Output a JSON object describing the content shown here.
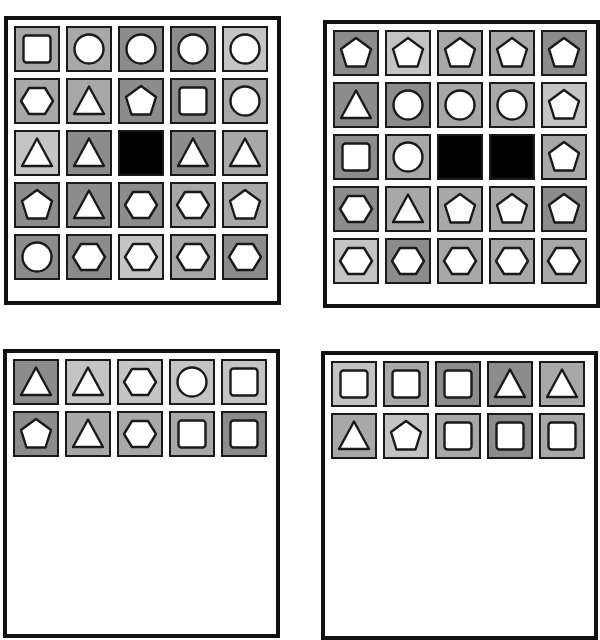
{
  "colors": {
    "dark": "#8c8c8c",
    "mid": "#a8a8a8",
    "light": "#c4c4c4",
    "black": "#000000",
    "shape_fill": "#ffffff",
    "shape_stroke": "#1a1a1a"
  },
  "panels": [
    {
      "id": "top-left",
      "rows": [
        [
          [
            "mid",
            "square"
          ],
          [
            "mid",
            "circle"
          ],
          [
            "dark",
            "circle"
          ],
          [
            "dark",
            "circle"
          ],
          [
            "light",
            "circle"
          ]
        ],
        [
          [
            "mid",
            "hexagon"
          ],
          [
            "mid",
            "triangle"
          ],
          [
            "dark",
            "pentagon"
          ],
          [
            "dark",
            "square"
          ],
          [
            "mid",
            "circle"
          ]
        ],
        [
          [
            "light",
            "triangle"
          ],
          [
            "dark",
            "triangle"
          ],
          [
            "black",
            "none"
          ],
          [
            "dark",
            "triangle"
          ],
          [
            "mid",
            "triangle"
          ]
        ],
        [
          [
            "dark",
            "pentagon"
          ],
          [
            "dark",
            "triangle"
          ],
          [
            "dark",
            "hexagon"
          ],
          [
            "mid",
            "hexagon"
          ],
          [
            "mid",
            "pentagon"
          ]
        ],
        [
          [
            "dark",
            "circle"
          ],
          [
            "dark",
            "hexagon"
          ],
          [
            "light",
            "hexagon"
          ],
          [
            "mid",
            "hexagon"
          ],
          [
            "dark",
            "hexagon"
          ]
        ]
      ]
    },
    {
      "id": "top-right",
      "rows": [
        [
          [
            "dark",
            "pentagon"
          ],
          [
            "light",
            "pentagon"
          ],
          [
            "mid",
            "pentagon"
          ],
          [
            "mid",
            "pentagon"
          ],
          [
            "dark",
            "pentagon"
          ]
        ],
        [
          [
            "dark",
            "triangle"
          ],
          [
            "dark",
            "circle"
          ],
          [
            "mid",
            "circle"
          ],
          [
            "mid",
            "circle"
          ],
          [
            "light",
            "pentagon"
          ]
        ],
        [
          [
            "dark",
            "square"
          ],
          [
            "mid",
            "circle"
          ],
          [
            "black",
            "none"
          ],
          [
            "black",
            "none"
          ],
          [
            "mid",
            "pentagon"
          ]
        ],
        [
          [
            "dark",
            "hexagon"
          ],
          [
            "mid",
            "triangle"
          ],
          [
            "mid",
            "pentagon"
          ],
          [
            "mid",
            "pentagon"
          ],
          [
            "dark",
            "pentagon"
          ]
        ],
        [
          [
            "light",
            "hexagon"
          ],
          [
            "dark",
            "hexagon"
          ],
          [
            "mid",
            "hexagon"
          ],
          [
            "mid",
            "hexagon"
          ],
          [
            "mid",
            "hexagon"
          ]
        ]
      ]
    },
    {
      "id": "bottom-left",
      "rows": [
        [
          [
            "dark",
            "triangle"
          ],
          [
            "light",
            "triangle"
          ],
          [
            "light",
            "hexagon"
          ],
          [
            "light",
            "circle"
          ],
          [
            "light",
            "square"
          ]
        ],
        [
          [
            "dark",
            "pentagon"
          ],
          [
            "mid",
            "triangle"
          ],
          [
            "mid",
            "hexagon"
          ],
          [
            "mid",
            "square"
          ],
          [
            "dark",
            "square"
          ]
        ]
      ]
    },
    {
      "id": "bottom-right",
      "rows": [
        [
          [
            "light",
            "square"
          ],
          [
            "mid",
            "square"
          ],
          [
            "dark",
            "square"
          ],
          [
            "dark",
            "triangle"
          ],
          [
            "mid",
            "triangle"
          ]
        ],
        [
          [
            "mid",
            "triangle"
          ],
          [
            "light",
            "pentagon"
          ],
          [
            "mid",
            "square"
          ],
          [
            "dark",
            "square"
          ],
          [
            "mid",
            "square"
          ]
        ]
      ]
    }
  ],
  "layout": [
    {
      "left": 4,
      "top": 16,
      "width": 277,
      "height": 289
    },
    {
      "left": 323,
      "top": 20,
      "width": 277,
      "height": 288
    },
    {
      "left": 3,
      "top": 349,
      "width": 277,
      "height": 289
    },
    {
      "left": 321,
      "top": 351,
      "width": 277,
      "height": 289
    }
  ]
}
